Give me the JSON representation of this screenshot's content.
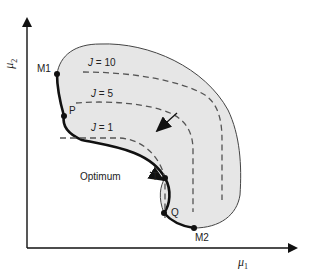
{
  "figure": {
    "type": "feasible-region-diagram",
    "axes": {
      "x_label": "μ",
      "x_label_sub": "1",
      "y_label": "μ",
      "y_label_sub": "2"
    },
    "points": [
      {
        "id": "M1",
        "label": "M1"
      },
      {
        "id": "P",
        "label": "P"
      },
      {
        "id": "T",
        "label": "T"
      },
      {
        "id": "Q",
        "label": "Q"
      },
      {
        "id": "M2",
        "label": "M2"
      }
    ],
    "contours": [
      {
        "label_var": "J",
        "label_eq": " = 10"
      },
      {
        "label_var": "J",
        "label_eq": " = 5"
      },
      {
        "label_var": "J",
        "label_eq": " = 1"
      }
    ],
    "annotation": "Optimum",
    "colors": {
      "region_fill": "#e6e6e6",
      "outline": "#444444",
      "pareto_front": "#111111",
      "dashed": "#555555"
    }
  }
}
